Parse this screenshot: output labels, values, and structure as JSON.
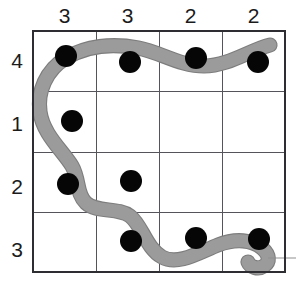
{
  "puzzle": {
    "title": "Snake grid logic puzzle",
    "grid": {
      "rows": 4,
      "cols": 4,
      "left": 33,
      "top": 31,
      "cell": 63,
      "line_color": "#55545a",
      "border_color": "#2e2e32"
    },
    "column_headers": [
      "3",
      "3",
      "2",
      "2"
    ],
    "row_headers": [
      "4",
      "1",
      "2",
      "3"
    ],
    "dots": {
      "color": "#060606",
      "radius": 11,
      "cells": [
        {
          "row": 0,
          "col": 0,
          "cx": 66,
          "cy": 56
        },
        {
          "row": 0,
          "col": 1,
          "cx": 130,
          "cy": 62
        },
        {
          "row": 0,
          "col": 2,
          "cx": 196,
          "cy": 58
        },
        {
          "row": 0,
          "col": 3,
          "cx": 258,
          "cy": 62
        },
        {
          "row": 1,
          "col": 0,
          "cx": 72,
          "cy": 121
        },
        {
          "row": 2,
          "col": 0,
          "cx": 68,
          "cy": 184
        },
        {
          "row": 2,
          "col": 1,
          "cx": 131,
          "cy": 181
        },
        {
          "row": 3,
          "col": 1,
          "cx": 131,
          "cy": 241
        },
        {
          "row": 3,
          "col": 2,
          "cx": 196,
          "cy": 238
        },
        {
          "row": 3,
          "col": 3,
          "cx": 259,
          "cy": 239
        }
      ]
    },
    "snake": {
      "body_color": "#9b9b9b",
      "edge_color": "#7d7d7d",
      "thickness": 13,
      "tail_end": "top-right",
      "head_end": "bottom-right",
      "path": "M 270 45 C 250 50 228 66 204 66 C 180 66 160 52 138 48 C 112 43 86 46 66 58 C 46 70 37 92 40 112 C 43 134 62 150 72 166 C 80 180 76 194 86 203 C 97 213 118 207 130 216 C 142 225 146 248 162 257 C 178 266 200 252 218 245 C 236 238 252 240 262 248 C 270 255 270 262 264 266 C 258 270 250 267 248 262"
    },
    "head_line": {
      "x1": 268,
      "y1": 258,
      "x2": 296,
      "y2": 258,
      "color": "#8a8a8a"
    }
  }
}
